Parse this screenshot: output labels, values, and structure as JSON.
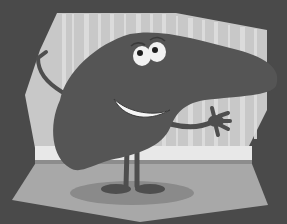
{
  "image": {
    "description": "Grayscale cartoon illustration of a smiling liver character waving in a room with striped wallpaper",
    "colors": {
      "background": "#4a4a4a",
      "wall": "#c8c8c8",
      "wall_stripe": "#dedede",
      "baseboard": "#e8e8e8",
      "floor": "#a8a8a8",
      "shadow": "#8a8a8a",
      "liver": "#555555",
      "eye_white": "#f2f2f2",
      "pupil": "#1e1e1e",
      "mouth": "#f5f5f5"
    }
  }
}
